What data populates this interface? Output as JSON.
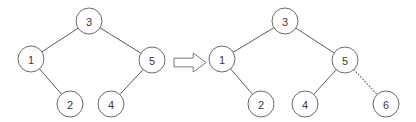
{
  "figure": {
    "background_color": "#ffffff",
    "node_stroke_color": "#6b6b6b",
    "edge_color": "#5a5a5a",
    "label_color": "#3a3a3a",
    "node_radius": 13
  },
  "transform_arrow": {
    "icon": "double-right-arrow-icon",
    "glyph": "⇒",
    "x": 174,
    "y": 53,
    "width": 32,
    "height": 19,
    "stroke_color": "#7a7a7a"
  },
  "left_tree": {
    "caption": "before",
    "nodes": [
      {
        "id": "L3",
        "label": "3",
        "x": 89,
        "y": 21
      },
      {
        "id": "L1",
        "label": "1",
        "x": 31,
        "y": 59
      },
      {
        "id": "L5",
        "label": "5",
        "x": 152,
        "y": 60
      },
      {
        "id": "L2",
        "label": "2",
        "x": 70,
        "y": 104
      },
      {
        "id": "L4",
        "label": "4",
        "x": 111,
        "y": 104
      }
    ],
    "edges": [
      {
        "from": "L3",
        "to": "L1",
        "style": "solid"
      },
      {
        "from": "L3",
        "to": "L5",
        "style": "solid"
      },
      {
        "from": "L1",
        "to": "L2",
        "style": "solid"
      },
      {
        "from": "L5",
        "to": "L4",
        "style": "solid"
      }
    ]
  },
  "right_tree": {
    "caption": "after",
    "nodes": [
      {
        "id": "R3",
        "label": "3",
        "x": 285,
        "y": 21
      },
      {
        "id": "R1",
        "label": "1",
        "x": 222,
        "y": 59
      },
      {
        "id": "R5",
        "label": "5",
        "x": 345,
        "y": 60
      },
      {
        "id": "R2",
        "label": "2",
        "x": 261,
        "y": 104
      },
      {
        "id": "R4",
        "label": "4",
        "x": 305,
        "y": 104
      },
      {
        "id": "R6",
        "label": "6",
        "x": 386,
        "y": 104
      }
    ],
    "edges": [
      {
        "from": "R3",
        "to": "R1",
        "style": "solid"
      },
      {
        "from": "R3",
        "to": "R5",
        "style": "solid"
      },
      {
        "from": "R1",
        "to": "R2",
        "style": "solid"
      },
      {
        "from": "R5",
        "to": "R4",
        "style": "solid"
      },
      {
        "from": "R5",
        "to": "R6",
        "style": "dotted"
      }
    ]
  }
}
